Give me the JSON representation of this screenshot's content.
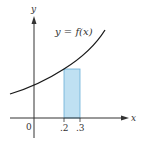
{
  "diagram": {
    "curve_label": "y = f(x)",
    "x_axis_label": "x",
    "y_axis_label": "y",
    "origin_label": "0",
    "ticks": [
      ".2",
      ".3"
    ],
    "rectangle": {
      "x_from": 0.2,
      "x_to": 0.3,
      "fill": "#bfe0f2",
      "stroke": "#6aaed6"
    },
    "colors": {
      "curve": "#1a1a1a",
      "axes": "#333333"
    }
  }
}
